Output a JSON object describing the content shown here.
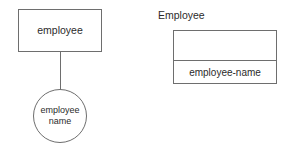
{
  "diagram": {
    "background_color": "#ffffff",
    "stroke_color": "#6e6e6e",
    "text_color": "#2b2b2b",
    "er_model": {
      "entity": {
        "label": "employee",
        "shape": "rectangle"
      },
      "connector": {
        "kind": "line",
        "label": ""
      },
      "attribute": {
        "shape": "ellipse",
        "label_line_1": "employee",
        "label_line_2": "name"
      }
    },
    "relational_table": {
      "caption": "Employee",
      "header_cells": [
        ""
      ],
      "rows": [
        [
          "employee-name"
        ]
      ]
    }
  }
}
